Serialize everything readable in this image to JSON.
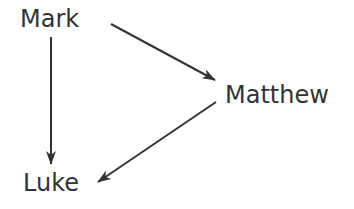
{
  "diagram": {
    "nodes": [
      {
        "id": "mark",
        "label": "Mark"
      },
      {
        "id": "matthew",
        "label": "Matthew"
      },
      {
        "id": "luke",
        "label": "Luke"
      }
    ],
    "edges": [
      {
        "from": "Mark",
        "to": "Matthew"
      },
      {
        "from": "Mark",
        "to": "Luke"
      },
      {
        "from": "Matthew",
        "to": "Luke"
      }
    ],
    "colors": {
      "text": "#333333",
      "arrow": "#333333",
      "background": "#ffffff"
    }
  }
}
